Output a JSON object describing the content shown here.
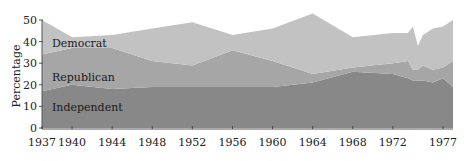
{
  "chart_data": {
    "type": "area",
    "stacked": true,
    "title": "",
    "xlabel": "",
    "ylabel": "Percentage",
    "ylim": [
      0,
      50
    ],
    "yticks": [
      0,
      10,
      20,
      30,
      40,
      50
    ],
    "xticks": [
      "1937",
      "1940",
      "1944",
      "1948",
      "1952",
      "1956",
      "1960",
      "1964",
      "1968",
      "1972",
      "1977"
    ],
    "grid": false,
    "legend": "inline labels",
    "x": [
      1937,
      1940,
      1944,
      1948,
      1952,
      1956,
      1960,
      1964,
      1968,
      1972,
      1973.5,
      1974,
      1974.5,
      1975,
      1976,
      1977,
      1978
    ],
    "series": [
      {
        "name": "Independent",
        "color": "#888888",
        "values": [
          17,
          20,
          18,
          19,
          19,
          19,
          19,
          21,
          26,
          25,
          23,
          22,
          22,
          22,
          21,
          23,
          19
        ]
      },
      {
        "name": "Republican",
        "color": "#a6a6a6",
        "values": [
          17,
          17,
          19,
          12,
          10,
          17,
          12,
          4,
          2,
          5,
          8,
          5,
          5,
          7,
          6,
          5,
          12
        ]
      },
      {
        "name": "Democrat",
        "color": "#c2c2c2",
        "values": [
          16,
          5,
          6,
          15,
          20,
          7,
          15,
          28,
          14,
          14,
          13,
          20,
          11,
          14,
          19,
          19,
          19
        ]
      }
    ]
  },
  "labels": {
    "democrat": "Democrat",
    "republican": "Republican",
    "independent": "Independent",
    "ylabel": "Percentage"
  }
}
